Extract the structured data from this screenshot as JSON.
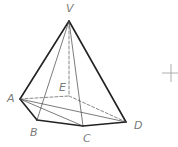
{
  "figure": {
    "type": "pyramid",
    "apex": "V",
    "base_vertices": [
      "A",
      "B",
      "C",
      "D",
      "E"
    ],
    "labels": {
      "V": "V",
      "A": "A",
      "B": "B",
      "C": "C",
      "D": "D",
      "E": "E"
    },
    "edges": [
      {
        "from": "V",
        "to": "A",
        "style": "solid-thick"
      },
      {
        "from": "V",
        "to": "D",
        "style": "solid-thick"
      },
      {
        "from": "A",
        "to": "B",
        "style": "solid-thick"
      },
      {
        "from": "B",
        "to": "C",
        "style": "solid-thick"
      },
      {
        "from": "C",
        "to": "D",
        "style": "solid-thick"
      },
      {
        "from": "V",
        "to": "B",
        "style": "solid-thin"
      },
      {
        "from": "V",
        "to": "C",
        "style": "solid-thin"
      },
      {
        "from": "A",
        "to": "C",
        "style": "solid-thin"
      },
      {
        "from": "A",
        "to": "D",
        "style": "solid-thin"
      },
      {
        "from": "V",
        "to": "E",
        "style": "dashed"
      },
      {
        "from": "A",
        "to": "E",
        "style": "dashed"
      },
      {
        "from": "E",
        "to": "D",
        "style": "dashed"
      }
    ],
    "colors": {
      "edge": "#222222",
      "thin_edge": "#444444",
      "dashed_edge": "#555555",
      "label": "#7a7a7a",
      "crosshair": "#9a9a9a"
    }
  }
}
